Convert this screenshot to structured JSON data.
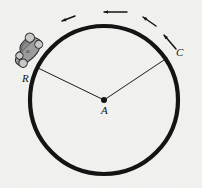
{
  "figure": {
    "type": "geometry-diagram",
    "background_color": "#f6f6f4",
    "ink_color": "#141414"
  },
  "track": {
    "name": "circular-track",
    "center_x": 104,
    "center_y": 100,
    "radius": 74,
    "stroke_width": 4.2,
    "color": "#141414"
  },
  "points": [
    {
      "id": "A",
      "label": "A",
      "role": "center",
      "x": 104,
      "y": 100,
      "label_x": 101,
      "label_y": 114,
      "dot_radius": 3.0
    },
    {
      "id": "R",
      "label": "R",
      "role": "car-position",
      "x": 38,
      "y": 68,
      "label_x": 22,
      "label_y": 82
    },
    {
      "id": "C",
      "label": "C",
      "role": "track-point",
      "x": 167,
      "y": 58,
      "label_x": 176,
      "label_y": 56
    }
  ],
  "radii": [
    {
      "name": "radius-A-R",
      "x1": 104,
      "y1": 100,
      "x2": 38,
      "y2": 68,
      "stroke_width": 1.0
    },
    {
      "name": "radius-A-C",
      "x1": 104,
      "y1": 100,
      "x2": 167,
      "y2": 58,
      "stroke_width": 1.0
    }
  ],
  "motion": {
    "direction": "counterclockwise",
    "arrow_color": "#141414",
    "arrows": [
      {
        "name": "motion-arrow-1",
        "x1": 127,
        "y1": 12,
        "x2": 104,
        "y2": 12,
        "head": 4.4
      },
      {
        "name": "motion-arrow-2",
        "x1": 75,
        "y1": 16,
        "x2": 62,
        "y2": 21,
        "head": 4.4
      },
      {
        "name": "motion-arrow-3",
        "x1": 156,
        "y1": 26,
        "x2": 143,
        "y2": 17,
        "head": 4.4
      },
      {
        "name": "motion-arrow-4",
        "x1": 176,
        "y1": 49,
        "x2": 164,
        "y2": 35,
        "head": 4.4
      }
    ]
  },
  "car": {
    "name": "car",
    "x": 28,
    "y": 52,
    "rotation_deg": -45,
    "body_color": "#9c9c9c",
    "body_stroke": "#2e2e2e",
    "wheel_color": "#c8c8c8",
    "wheel_stroke": "#2e2e2e",
    "decal": "45"
  }
}
